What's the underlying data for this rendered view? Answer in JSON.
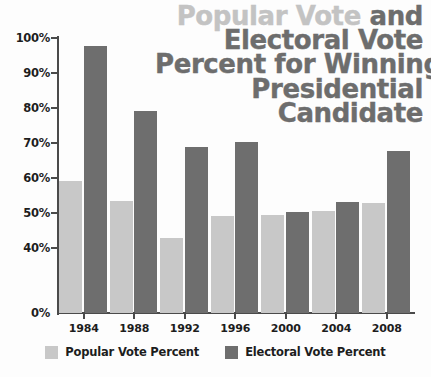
{
  "title": {
    "line1_light": "Popular Vote",
    "line1_dark": " and",
    "line2": "Electoral Vote",
    "line3": "Percent for Winning",
    "line4": "Presidential",
    "line5": "Candidate"
  },
  "legend": {
    "items": [
      {
        "label": "Popular Vote Percent",
        "color": "#c8c8c8",
        "swatch_name": "legend-swatch-popular"
      },
      {
        "label": "Electoral Vote Percent",
        "color": "#6e6e6e",
        "swatch_name": "legend-swatch-electoral"
      }
    ]
  },
  "colors": {
    "popular": "#c8c8c8",
    "electoral": "#6e6e6e",
    "title_light": "#c3c3c3",
    "title_dark": "#6d6d6d",
    "axis": "#4a4a4a",
    "text": "#1d1d1d",
    "background": "#fdfdfd"
  },
  "chart_data": {
    "type": "bar",
    "title": "Popular Vote and Electoral Vote Percent for Winning Presidential Candidate",
    "xlabel": "",
    "ylabel": "",
    "categories": [
      "1984",
      "1988",
      "1992",
      "1996",
      "2000",
      "2004",
      "2008"
    ],
    "series": [
      {
        "name": "Popular Vote Percent",
        "color": "#c8c8c8",
        "values": [
          59.2,
          53.5,
          43.0,
          49.2,
          49.3,
          50.7,
          52.9
        ]
      },
      {
        "name": "Electoral Vote Percent",
        "color": "#6e6e6e",
        "values": [
          97.6,
          79.2,
          68.8,
          70.4,
          50.4,
          53.2,
          67.8
        ]
      }
    ],
    "ytick_labels": [
      "100%",
      "90%",
      "80%",
      "70%",
      "60%",
      "50%",
      "40%",
      "0%"
    ],
    "ytick_values": [
      100,
      90,
      80,
      70,
      60,
      50,
      40,
      0
    ],
    "ylim": [
      0,
      100
    ],
    "axis_break": true,
    "axis_break_note": "y-axis is broken: bars are drawn from a 0% baseline but the scale below 40% is compressed",
    "grid": false,
    "legend_position": "bottom"
  }
}
